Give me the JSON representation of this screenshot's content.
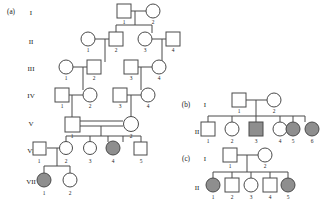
{
  "figure": {
    "type": "pedigree-chart",
    "symbol_legend": {
      "square": "male",
      "circle": "female",
      "filled_gray": "affected",
      "unfilled_white": "unaffected",
      "double_line": "consanguineous-mating"
    },
    "colors": {
      "stroke": "#4a4a4a",
      "affected_fill": "#8e8e8e",
      "unaffected_fill": "#ffffff",
      "background": "#ffffff",
      "text": "#1a1a1a"
    }
  },
  "panels": [
    {
      "label": "(a)",
      "generation_labels": [
        "I",
        "II",
        "III",
        "IV",
        "V",
        "VI",
        "VII"
      ],
      "individuals": [
        {
          "gen": "I",
          "id": "1",
          "sex": "male",
          "affected": false
        },
        {
          "gen": "I",
          "id": "2",
          "sex": "female",
          "affected": false
        },
        {
          "gen": "II",
          "id": "1",
          "sex": "female",
          "affected": false
        },
        {
          "gen": "II",
          "id": "2",
          "sex": "male",
          "affected": false
        },
        {
          "gen": "II",
          "id": "3",
          "sex": "female",
          "affected": false
        },
        {
          "gen": "II",
          "id": "4",
          "sex": "male",
          "affected": false
        },
        {
          "gen": "III",
          "id": "1",
          "sex": "female",
          "affected": false
        },
        {
          "gen": "III",
          "id": "2",
          "sex": "male",
          "affected": false
        },
        {
          "gen": "III",
          "id": "3",
          "sex": "male",
          "affected": false
        },
        {
          "gen": "III",
          "id": "4",
          "sex": "female",
          "affected": false
        },
        {
          "gen": "IV",
          "id": "1",
          "sex": "male",
          "affected": false
        },
        {
          "gen": "IV",
          "id": "2",
          "sex": "female",
          "affected": false
        },
        {
          "gen": "IV",
          "id": "3",
          "sex": "male",
          "affected": false
        },
        {
          "gen": "IV",
          "id": "4",
          "sex": "female",
          "affected": false
        },
        {
          "gen": "V",
          "id": "1",
          "sex": "male",
          "affected": false
        },
        {
          "gen": "V",
          "id": "2",
          "sex": "female",
          "affected": false
        },
        {
          "gen": "VI",
          "id": "1",
          "sex": "male",
          "affected": false
        },
        {
          "gen": "VI",
          "id": "2",
          "sex": "female",
          "affected": false
        },
        {
          "gen": "VI",
          "id": "3",
          "sex": "female",
          "affected": false
        },
        {
          "gen": "VI",
          "id": "4",
          "sex": "female",
          "affected": true
        },
        {
          "gen": "VI",
          "id": "5",
          "sex": "male",
          "affected": false
        },
        {
          "gen": "VII",
          "id": "1",
          "sex": "female",
          "affected": true
        },
        {
          "gen": "VII",
          "id": "2",
          "sex": "female",
          "affected": false
        }
      ],
      "consanguineous_matings": [
        "V-1 x V-2"
      ]
    },
    {
      "label": "(b)",
      "generation_labels": [
        "I",
        "II"
      ],
      "individuals": [
        {
          "gen": "I",
          "id": "1",
          "sex": "male",
          "affected": false
        },
        {
          "gen": "I",
          "id": "2",
          "sex": "female",
          "affected": false
        },
        {
          "gen": "II",
          "id": "1",
          "sex": "male",
          "affected": false
        },
        {
          "gen": "II",
          "id": "2",
          "sex": "female",
          "affected": false
        },
        {
          "gen": "II",
          "id": "3",
          "sex": "male",
          "affected": true
        },
        {
          "gen": "II",
          "id": "4",
          "sex": "female",
          "affected": false
        },
        {
          "gen": "II",
          "id": "5",
          "sex": "female",
          "affected": true
        },
        {
          "gen": "II",
          "id": "6",
          "sex": "female",
          "affected": true
        }
      ]
    },
    {
      "label": "(c)",
      "generation_labels": [
        "I",
        "II"
      ],
      "individuals": [
        {
          "gen": "I",
          "id": "1",
          "sex": "male",
          "affected": false
        },
        {
          "gen": "I",
          "id": "2",
          "sex": "female",
          "affected": false
        },
        {
          "gen": "II",
          "id": "1",
          "sex": "female",
          "affected": true
        },
        {
          "gen": "II",
          "id": "2",
          "sex": "male",
          "affected": false
        },
        {
          "gen": "II",
          "id": "3",
          "sex": "female",
          "affected": false
        },
        {
          "gen": "II",
          "id": "4",
          "sex": "male",
          "affected": false
        },
        {
          "gen": "II",
          "id": "5",
          "sex": "female",
          "affected": true
        }
      ]
    }
  ],
  "text": {
    "panel_a_label": "(a)",
    "panel_b_label": "(b)",
    "panel_c_label": "(c)",
    "gen_I": "I",
    "gen_II": "II",
    "gen_III": "III",
    "gen_IV": "IV",
    "gen_V": "V",
    "gen_VI": "VI",
    "gen_VII": "VII",
    "n1": "1",
    "n2": "2",
    "n3": "3",
    "n4": "4",
    "n5": "5",
    "n6": "6"
  }
}
